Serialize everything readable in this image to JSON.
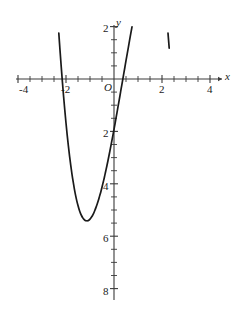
{
  "figure": {
    "background_color": "#ffffff",
    "axis_color": "#3a3a3a",
    "curve_color": "#1a1a1a",
    "label_color": "#1a1a1a",
    "origin_label": "O",
    "x_axis_name": "x",
    "y_axis_name": "y"
  },
  "chart_data": {
    "type": "line",
    "title": "",
    "xlabel": "x",
    "ylabel": "y",
    "xlim": [
      -4.0,
      4.0
    ],
    "ylim": [
      -8.0,
      2.0
    ],
    "grid": false,
    "legend": null,
    "x_tick_labels": [
      "-4",
      "-2",
      "2",
      "4"
    ],
    "x_tick_values": [
      -4,
      -2,
      2,
      4
    ],
    "y_tick_labels": [
      "2",
      "2",
      "4",
      "6",
      "8"
    ],
    "y_tick_values": [
      2,
      -2,
      -4,
      -6,
      -8
    ],
    "minor_tick_interval": 0.5,
    "y_minor_tick_interval": 0.5,
    "annotations": [],
    "series": [
      {
        "name": "quartic",
        "equation": "y = x^4 - 5x^2 - 0.35x + 0.35",
        "x": [
          -2.35,
          -2.3,
          -2.25,
          -2.2,
          -2.15,
          -2.1,
          -2.05,
          -2.0,
          -1.95,
          -1.9,
          -1.85,
          -1.8,
          -1.75,
          -1.7,
          -1.65,
          -1.6,
          -1.55,
          -1.5,
          -1.45,
          -1.4,
          -1.35,
          -1.3,
          -1.25,
          -1.2,
          -1.15,
          -1.1,
          -1.05,
          -1.0,
          -0.95,
          -0.9,
          -0.85,
          -0.8,
          -0.75,
          -0.7,
          -0.65,
          -0.6,
          -0.55,
          -0.5,
          -0.45,
          -0.4,
          -0.35,
          -0.3,
          -0.25,
          -0.2,
          -0.15,
          -0.1,
          -0.05,
          0.0,
          0.05,
          0.1,
          0.15,
          0.2,
          0.25,
          0.3,
          0.35,
          0.4,
          0.45,
          0.5,
          0.55,
          0.6,
          0.65,
          0.7,
          0.75,
          0.8,
          0.85,
          0.9,
          0.95,
          1.0,
          1.05,
          1.1,
          1.15,
          1.2,
          1.25,
          1.3,
          1.35,
          1.4,
          1.45,
          1.5,
          1.55,
          1.6,
          1.65,
          1.7,
          1.75,
          1.8,
          1.85,
          1.9,
          1.95,
          2.0,
          2.05,
          2.1,
          2.15,
          2.2,
          2.25,
          2.3
        ],
        "y": [
          2.43,
          1.75,
          1.1,
          0.48,
          -0.11,
          -0.67,
          -1.19,
          -1.68,
          -2.14,
          -2.56,
          -2.95,
          -3.31,
          -3.64,
          -3.93,
          -4.2,
          -4.44,
          -4.65,
          -4.83,
          -4.99,
          -5.12,
          -5.22,
          -5.3,
          -5.36,
          -5.4,
          -5.41,
          -5.41,
          -5.39,
          -5.35,
          -5.29,
          -5.22,
          -5.13,
          -5.02,
          -4.9,
          -4.77,
          -4.63,
          -4.47,
          -4.31,
          -4.13,
          -3.94,
          -3.75,
          -3.54,
          -3.33,
          -3.11,
          -2.88,
          -2.65,
          -2.41,
          -2.17,
          -1.92,
          -1.67,
          -1.41,
          -1.15,
          -0.89,
          -0.63,
          -0.36,
          -0.1,
          0.17,
          0.43,
          0.7,
          0.96,
          1.22,
          1.48,
          1.74,
          1.99,
          2.24,
          2.48,
          2.72,
          2.95,
          3.17,
          3.38,
          3.58,
          3.77,
          3.94,
          4.1,
          4.25,
          4.38,
          4.49,
          4.58,
          4.65,
          4.69,
          4.71,
          4.71,
          4.67,
          4.61,
          4.51,
          4.38,
          4.21,
          4.0,
          3.75,
          3.45,
          3.11,
          2.71,
          2.26,
          1.75,
          1.18
        ],
        "key_points": {
          "local_max_near_origin": [
            -0.04,
            0.36
          ],
          "left_minimum": [
            -1.55,
            -6.42
          ],
          "right_minimum": [
            1.6,
            -7.42
          ],
          "roots": [
            -2.17,
            -0.26,
            0.22,
            2.15
          ]
        }
      }
    ]
  }
}
